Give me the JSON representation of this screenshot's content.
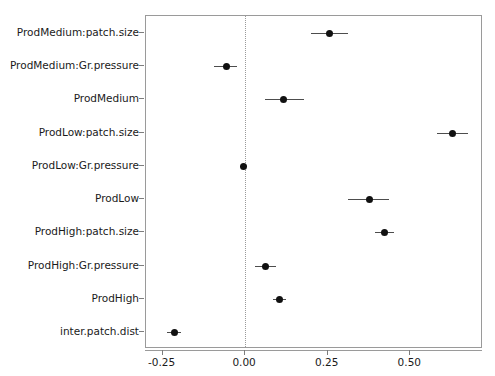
{
  "chart_data": {
    "type": "scatter",
    "plot_style": "forest-plot",
    "title": "",
    "subtitle": "",
    "xlabel": "",
    "ylabel": "",
    "xlim": [
      -0.3,
      0.72
    ],
    "xticks": [
      -0.25,
      0.0,
      0.25,
      0.5
    ],
    "xticklabels": [
      "-0.25",
      "0.00",
      "0.25",
      "0.50"
    ],
    "grid": false,
    "legend": null,
    "reference_line": {
      "x": 0.0,
      "style": "dotted",
      "color": "#9a9a9a"
    },
    "point_color": "#111111",
    "errorbar_color": "#4d4d4d",
    "panel_border_color": "#9a9a9a",
    "categories": [
      "ProdMedium:patch.size",
      "ProdMedium:Gr.pressure",
      "ProdMedium",
      "ProdLow:patch.size",
      "ProdLow:Gr.pressure",
      "ProdLow",
      "ProdHigh:patch.size",
      "ProdHigh:Gr.pressure",
      "ProdHigh",
      "inter.patch.dist"
    ],
    "points": [
      {
        "label": "ProdMedium:patch.size",
        "estimate": 0.254,
        "low": 0.199,
        "high": 0.312
      },
      {
        "label": "ProdMedium:Gr.pressure",
        "estimate": -0.056,
        "low": -0.094,
        "high": -0.024
      },
      {
        "label": "ProdMedium",
        "estimate": 0.117,
        "low": 0.059,
        "high": 0.178
      },
      {
        "label": "ProdLow:patch.size",
        "estimate": 0.628,
        "low": 0.581,
        "high": 0.676
      },
      {
        "label": "ProdLow:Gr.pressure",
        "estimate": -0.005,
        "low": -0.014,
        "high": 0.005
      },
      {
        "label": "ProdLow",
        "estimate": 0.377,
        "low": 0.312,
        "high": 0.435
      },
      {
        "label": "ProdHigh:patch.size",
        "estimate": 0.421,
        "low": 0.394,
        "high": 0.452
      },
      {
        "label": "ProdHigh:Gr.pressure",
        "estimate": 0.061,
        "low": 0.029,
        "high": 0.094
      },
      {
        "label": "ProdHigh",
        "estimate": 0.103,
        "low": 0.084,
        "high": 0.123
      },
      {
        "label": "inter.patch.dist",
        "estimate": -0.215,
        "low": -0.235,
        "high": -0.194
      }
    ]
  }
}
